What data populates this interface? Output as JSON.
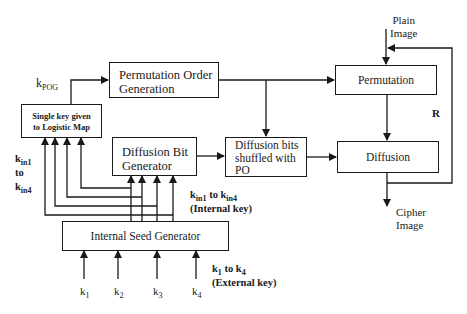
{
  "diagram": {
    "blocks": {
      "permutation_order_generation": {
        "line1": "Permutation Order",
        "line2": "Generation"
      },
      "single_key": {
        "line1": "Single key given",
        "line2": "to Logistic Map"
      },
      "diffusion_bit_generator": {
        "line1": "Diffusion Bit",
        "line2": "Generator"
      },
      "diffusion_bits_shuffled": {
        "line1": "Diffusion bits",
        "line2": "shuffled with",
        "line3": "PO"
      },
      "permutation": {
        "label": "Permutation"
      },
      "diffusion": {
        "label": "Diffusion"
      },
      "internal_seed_generator": {
        "label": "Internal Seed Generator"
      }
    },
    "labels": {
      "k_pog": {
        "base": "k",
        "sub": "POG"
      },
      "plain_image": {
        "line1": "Plain",
        "line2": "Image"
      },
      "cipher_image": {
        "line1": "Cipher",
        "line2": "Image"
      },
      "feedback": "R",
      "kin_left": {
        "base1": "k",
        "sub1": "in1",
        "mid": "to",
        "base2": "k",
        "sub2": "in4"
      },
      "internal_key": {
        "base1": "k",
        "sub1": "in1",
        "to": " to ",
        "base2": "k",
        "sub2": "in4",
        "line2": "(Internal key)"
      },
      "external_key": {
        "base1": "k",
        "sub1": "1",
        "to": " to ",
        "base2": "k",
        "sub2": "4",
        "line2": "(External key)"
      },
      "external_inputs": [
        {
          "base": "k",
          "sub": "1"
        },
        {
          "base": "k",
          "sub": "2"
        },
        {
          "base": "k",
          "sub": "3"
        },
        {
          "base": "k",
          "sub": "4"
        }
      ]
    },
    "colors": {
      "stroke": "#1a1a1a",
      "background": "#ffffff"
    }
  }
}
